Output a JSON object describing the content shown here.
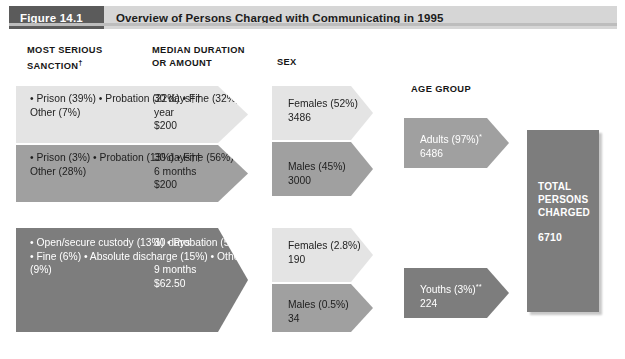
{
  "figure": {
    "badge": "Figure 14.1",
    "title": "Overview of Persons Charged with Communicating in 1995"
  },
  "columns": {
    "sanction": "MOST SERIOUS\nSANCTION",
    "sanction_dagger": "†",
    "duration": "MEDIAN DURATION\nOR AMOUNT",
    "sex": "SEX",
    "age": "AGE GROUP"
  },
  "sanction_blocks": [
    {
      "tone": "light",
      "items": "• Prison (39%)\n• Probation (22%)\n• Fine (32%)\n• Other (7%)",
      "durations": "30 days††\nyear\n$200"
    },
    {
      "tone": "mid",
      "items": "• Prison (3%)\n• Probation (13%)\n• Fine (56%)\n• Other (28%)",
      "durations": "30 days††\n6 months\n$200"
    },
    {
      "tone": "dark",
      "items": "• Open/secure\n   custody (13%)\n• Probation (57%)\n• Fine (6%)\n• Absolute discharge\n   (15%)\n• Other (9%)",
      "durations": "30 days\n\n9 months\n$62.50"
    }
  ],
  "sex_blocks": [
    {
      "tone": "light",
      "text": "Females (52%)\n3486"
    },
    {
      "tone": "mid",
      "text": "Males (45%)\n3000"
    },
    {
      "tone": "light",
      "text": "Females (2.8%)\n190"
    },
    {
      "tone": "mid",
      "text": "Males (0.5%)\n34"
    }
  ],
  "age_blocks": [
    {
      "tone": "mid",
      "label": "Adults (97%)",
      "mark": "*",
      "value": "6486"
    },
    {
      "tone": "dark",
      "label": "Youths (3%)",
      "mark": "**",
      "value": "224"
    }
  ],
  "total": {
    "label": "TOTAL\nPERSONS\nCHARGED",
    "value": "6710"
  },
  "colors": {
    "light": "#e4e4e4",
    "mid": "#a0a0a0",
    "dark": "#7d7d7d",
    "badge": "#5b5b5b",
    "titlebar": "#d6d6d6"
  }
}
